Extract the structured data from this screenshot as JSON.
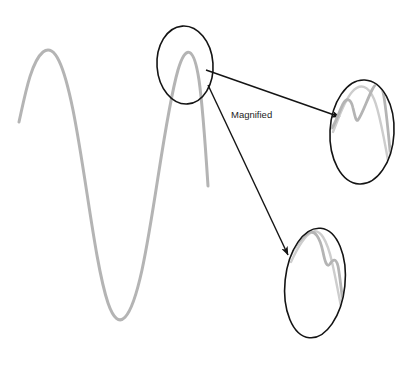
{
  "figure": {
    "type": "annotated-waveform-diagram",
    "background_color": "#ffffff",
    "canvas": {
      "width": 412,
      "height": 365
    },
    "annotation_label": "Magnified",
    "colors": {
      "signal_curve": "#b4b4b4",
      "signal_curve_light": "#c9c9c9",
      "ellipse_outline": "#141414",
      "callout_line": "#141414",
      "label_text": "#1c1c1c"
    },
    "stroke_widths": {
      "signal_curve": 3.0,
      "signal_curve_detail": 2.6,
      "ellipse_outline": 1.6,
      "callout_line": 1.4
    },
    "main_signal": {
      "name": "primary-waveform",
      "description": "light gray sinusoid-like trace with one peak, one deep trough and a second peak",
      "path": "M 19 122 C 25 95 31 62 43 52 C 55 43 64 66 73 110 C 86 175 95 264 108 303 C 119 335 131 320 142 270 C 155 210 165 115 178 70 C 186 43 194 47 199 80 C 203 108 206 155 208 186"
    },
    "focus_ellipse": {
      "name": "focus-region-ellipse",
      "cx": 185,
      "cy": 65,
      "rx": 28,
      "ry": 39,
      "rotation": -4
    },
    "magnified_views": [
      {
        "name": "magnified-view-upper",
        "cx": 362,
        "cy": 132,
        "rx": 32,
        "ry": 52,
        "rotation": 3,
        "detail_path": "M 332 128 C 336 122 339 112 343 104 C 347 97 351 99 353 108 C 355 116 356 122 358 120 C 362 115 367 100 372 90 C 376 82 380 81 383 92 C 386 104 389 140 392 172",
        "ghost_path": "M 333 132 C 338 120 344 101 352 92 C 360 83 368 85 374 99 C 380 113 386 148 391 178"
      },
      {
        "name": "magnified-view-lower",
        "cx": 315,
        "cy": 283,
        "rx": 30,
        "ry": 55,
        "rotation": 6,
        "detail_path": "M 289 258 C 294 248 300 238 308 233 C 315 229 320 238 323 252 C 325 262 327 268 330 264 C 333 259 336 258 338 266 C 340 275 343 305 346 330",
        "ghost_path": "M 291 262 C 297 249 304 236 312 232 C 320 228 327 240 332 262 C 337 284 342 312 346 334"
      }
    ],
    "callouts": [
      {
        "name": "callout-arrow-upper",
        "from_x": 206,
        "from_y": 70,
        "to_x": 340,
        "to_y": 117,
        "target": "magnified-view-upper"
      },
      {
        "name": "callout-arrow-lower",
        "from_x": 208,
        "from_y": 85,
        "to_x": 288,
        "to_y": 255,
        "target": "magnified-view-lower"
      }
    ],
    "label_position": {
      "x": 231,
      "y": 115
    }
  },
  "chart_data": {
    "type": "line",
    "title": "",
    "xlabel": "",
    "ylabel": "",
    "legend": [],
    "grid": false,
    "annotations": [
      "Magnified"
    ],
    "series": [
      {
        "name": "primary-waveform",
        "description": "Light gray oscillating signal traced left to right across the canvas; contains fine local structure only visible under magnification.",
        "x": [
          19,
          43,
          73,
          108,
          142,
          178,
          199,
          208
        ],
        "y": [
          122,
          52,
          110,
          303,
          270,
          70,
          80,
          186
        ]
      },
      {
        "name": "magnified-detail-upper",
        "description": "Zoomed trace inside upper-right ellipse showing a small secondary bump, a dip, and the main peak.",
        "x": [
          332,
          343,
          353,
          358,
          372,
          383,
          392
        ],
        "y": [
          128,
          104,
          108,
          120,
          90,
          92,
          172
        ]
      },
      {
        "name": "magnified-detail-lower",
        "description": "Zoomed trace inside lower ellipse showing the main peak, a dip, and a secondary shoulder.",
        "x": [
          289,
          308,
          323,
          330,
          338,
          346
        ],
        "y": [
          258,
          233,
          252,
          264,
          266,
          330
        ]
      }
    ]
  }
}
